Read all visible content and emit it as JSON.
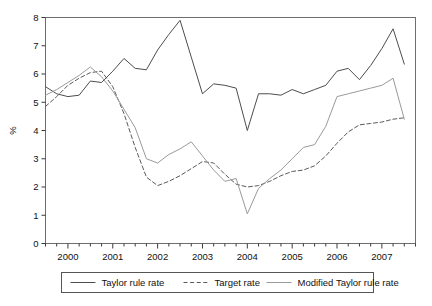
{
  "chart_data": {
    "type": "line",
    "title": "",
    "xlabel": "",
    "ylabel": "%",
    "ylim": [
      0,
      8
    ],
    "yticks": [
      0,
      1,
      2,
      3,
      4,
      5,
      6,
      7,
      8
    ],
    "ytick_labels": [
      "0",
      "1",
      "2",
      "3",
      "4",
      "5",
      "6",
      "7",
      "8"
    ],
    "xlim": [
      1999.5,
      2007.75
    ],
    "xticks": [
      2000,
      2001,
      2002,
      2003,
      2004,
      2005,
      2006,
      2007
    ],
    "xtick_labels": [
      "2000",
      "2001",
      "2002",
      "2003",
      "2004",
      "2005",
      "2006",
      "2007"
    ],
    "minor_xtick_step": 0.25,
    "grid": false,
    "legend_position": "bottom",
    "x": [
      1999.5,
      1999.75,
      2000.0,
      2000.25,
      2000.5,
      2000.75,
      2001.0,
      2001.25,
      2001.5,
      2001.75,
      2002.0,
      2002.25,
      2002.5,
      2002.75,
      2003.0,
      2003.25,
      2003.5,
      2003.75,
      2004.0,
      2004.25,
      2004.5,
      2004.75,
      2005.0,
      2005.25,
      2005.5,
      2005.75,
      2006.0,
      2006.25,
      2006.5,
      2006.75,
      2007.0,
      2007.25,
      2007.5
    ],
    "series": [
      {
        "name": "Taylor rule rate",
        "style": "solid",
        "color": "#4d4d4d",
        "values": [
          5.55,
          5.3,
          5.2,
          5.25,
          5.75,
          5.7,
          6.1,
          6.55,
          6.2,
          6.15,
          6.85,
          7.4,
          7.9,
          6.6,
          5.3,
          5.65,
          5.6,
          5.5,
          4.0,
          5.3,
          5.3,
          5.25,
          5.45,
          5.3,
          5.45,
          5.6,
          6.1,
          6.2,
          5.8,
          6.3,
          6.9,
          7.6,
          6.35
        ]
      },
      {
        "name": "Target rate",
        "style": "dashed",
        "color": "#5a5a5a",
        "values": [
          4.85,
          5.2,
          5.6,
          5.85,
          6.05,
          6.1,
          5.55,
          4.6,
          3.4,
          2.35,
          2.05,
          2.2,
          2.4,
          2.65,
          2.9,
          2.85,
          2.45,
          2.1,
          2.0,
          2.05,
          2.2,
          2.4,
          2.55,
          2.6,
          2.75,
          3.1,
          3.55,
          3.95,
          4.2,
          4.25,
          4.3,
          4.4,
          4.45
        ]
      },
      {
        "name": "Modified Taylor rule rate",
        "style": "solid",
        "color": "#9a9a9a",
        "values": [
          5.25,
          5.45,
          5.7,
          5.95,
          6.25,
          5.9,
          5.4,
          4.75,
          4.1,
          3.0,
          2.85,
          3.15,
          3.35,
          3.6,
          3.1,
          2.6,
          2.2,
          2.3,
          1.05,
          1.95,
          2.3,
          2.6,
          3.0,
          3.4,
          3.5,
          4.15,
          5.2,
          5.3,
          5.4,
          5.5,
          5.6,
          5.85,
          4.4
        ]
      }
    ]
  },
  "legend": {
    "items": [
      {
        "label": "Taylor rule rate"
      },
      {
        "label": "Target rate"
      },
      {
        "label": "Modified Taylor rule rate"
      }
    ]
  }
}
